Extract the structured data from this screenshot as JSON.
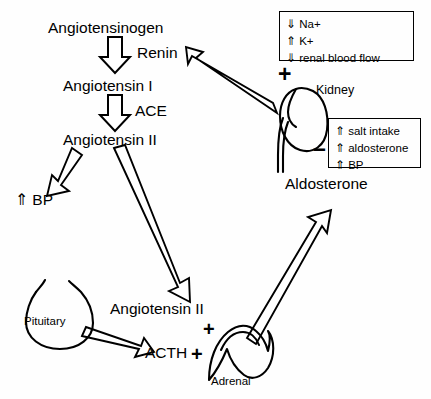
{
  "diagram": {
    "nodes": {
      "angiotensinogen": "Angiotensinogen",
      "renin": "Renin",
      "angiotensin_1": "Angiotensin I",
      "ace": "ACE",
      "angiotensin_2": "Angiotensin II",
      "bp_up": "⇑ BP",
      "angiotensin_2_lower": "Angiotensin II",
      "acth": "ACTH",
      "aldosterone": "Aldosterone"
    },
    "organs": {
      "kidney": "Kidney",
      "pituitary": "Pituitary",
      "adrenal": "Adrenal"
    },
    "signs": {
      "kidney_plus": "+",
      "kidney_minus": "–",
      "adrenal_plus_top": "+",
      "acth_plus": "+"
    },
    "stimulus_box": {
      "name": "kidney-stimulus-box",
      "rows": [
        {
          "arrow": "⇓",
          "label": "Na+"
        },
        {
          "arrow": "⇑",
          "label": "K+"
        },
        {
          "arrow": "⇓",
          "label": "renal blood flow"
        }
      ]
    },
    "inhibition_box": {
      "name": "kidney-inhibition-box",
      "rows": [
        {
          "arrow": "⇑",
          "label": "salt intake"
        },
        {
          "arrow": "⇑",
          "label": "aldosterone"
        },
        {
          "arrow": "⇑",
          "label": "BP"
        }
      ]
    },
    "colors": {
      "background": "#fefefe",
      "ink": "#000000",
      "arrow_fill": "#ffffff"
    }
  }
}
